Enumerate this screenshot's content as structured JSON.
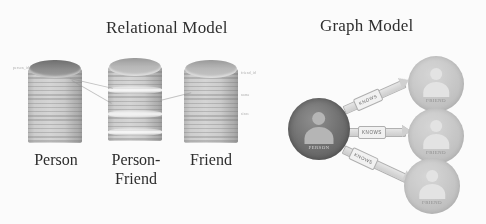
{
  "figure": {
    "relational": {
      "title": "Relational Model",
      "tables": [
        {
          "caption": "Person",
          "icon": "database-cylinder-icon"
        },
        {
          "caption": "Person-\nFriend",
          "icon": "database-cylinder-icon"
        },
        {
          "caption": "Friend",
          "icon": "database-cylinder-icon"
        }
      ],
      "annotations": {
        "person_left": "person_id",
        "friend_1": "friend_id",
        "friend_2": "name",
        "friend_3": "since"
      }
    },
    "graph": {
      "title": "Graph Model",
      "center_node": {
        "label": "PERSON",
        "icon": "person-avatar-icon"
      },
      "related_nodes": [
        {
          "label": "FRIEND",
          "icon": "person-avatar-icon"
        },
        {
          "label": "FRIEND",
          "icon": "person-avatar-icon"
        },
        {
          "label": "FRIEND",
          "icon": "person-avatar-icon"
        }
      ],
      "edges": [
        {
          "label": "KNOWS"
        },
        {
          "label": "KNOWS"
        },
        {
          "label": "KNOWS"
        }
      ]
    },
    "colors": {
      "background": "#ffffff",
      "text": "#2c2c2c",
      "cylinder": "#cdcdcd",
      "center_node": "#6d6d6d",
      "related_node": "#c6c6c6",
      "edge_ribbon": "#d2d2d2"
    }
  }
}
